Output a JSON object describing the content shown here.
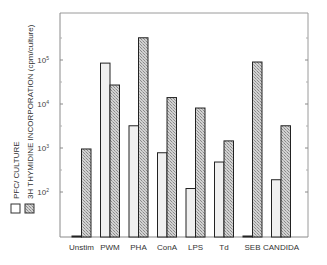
{
  "chart_data": {
    "type": "bar",
    "title": "",
    "xlabel": "",
    "ylabel": "",
    "y_scale": "log",
    "ylim": [
      10,
      1000000
    ],
    "y_ticks": [
      {
        "label": "10",
        "exp": "2",
        "value": 100
      },
      {
        "label": "10",
        "exp": "3",
        "value": 1000
      },
      {
        "label": "10",
        "exp": "4",
        "value": 10000
      },
      {
        "label": "10",
        "exp": "5",
        "value": 100000
      }
    ],
    "grid": false,
    "legend_position": "left, rotated vertical",
    "categories": [
      "Unstim",
      "PWM",
      "PHA",
      "ConA",
      "LPS",
      "Td",
      "SEB",
      "CANDIDA"
    ],
    "series": [
      {
        "name": "PFC/ CULTURE",
        "pattern": "plain-light",
        "color": "#f0f0f0",
        "values": [
          10,
          85000,
          3200,
          780,
          120,
          480,
          10,
          190
        ]
      },
      {
        "name": "3H THYMIDINE INCORPORATION (cpm/culture)",
        "pattern": "crosshatch",
        "color": "#b4b4b4",
        "values": [
          950,
          27000,
          320000,
          14000,
          8100,
          1450,
          90000,
          3200
        ]
      }
    ]
  },
  "legend": {
    "items": [
      {
        "label": "PFC/ CULTURE"
      },
      {
        "label": "3H THYMIDINE INCORPORATION (cpm/culture)"
      }
    ]
  }
}
